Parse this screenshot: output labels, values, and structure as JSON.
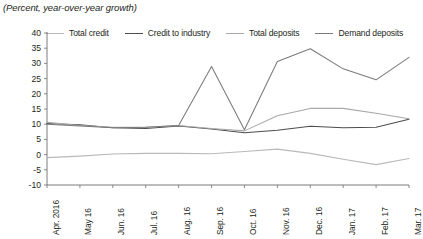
{
  "subtitle": "(Percent, year-over-year growth)",
  "colors": {
    "total_credit": "#b9b9b9",
    "credit_to_industry": "#4d4d4d",
    "total_deposits": "#a8a8a8",
    "demand_deposits": "#7a7a7a",
    "axis": "#6d6d6d",
    "text": "#231f20"
  },
  "legend": {
    "items": [
      {
        "label": "Total credit",
        "color": "#b9b9b9"
      },
      {
        "label": "Credit to industry",
        "color": "#4d4d4d"
      },
      {
        "label": "Total deposits",
        "color": "#a8a8a8"
      },
      {
        "label": "Demand deposits",
        "color": "#7a7a7a"
      }
    ]
  },
  "chart_data": {
    "type": "line",
    "title": "",
    "subtitle": "(Percent, year-over-year growth)",
    "xlabel": "",
    "ylabel": "",
    "ylim": [
      -10,
      40
    ],
    "ytick_step": 5,
    "yticks": [
      40,
      35,
      30,
      25,
      20,
      15,
      10,
      5,
      0,
      -5,
      -10
    ],
    "ytick_labels": [
      "40",
      "35",
      "30",
      "25",
      "20",
      "15",
      "10",
      "5",
      "0",
      "-5",
      "-10"
    ],
    "grid": false,
    "legend_position": "top",
    "categories": [
      "Apr. 2016",
      "May 16",
      "Jun. 16",
      "Jul. 16",
      "Aug. 16",
      "Sep. 16",
      "Oct. 16",
      "Nov. 16",
      "Dec. 16",
      "Jan. 17",
      "Feb. 17",
      "Mar. 17"
    ],
    "series": [
      {
        "name": "Total credit",
        "color": "#b9b9b9",
        "values": [
          -1.0,
          -0.5,
          0.2,
          0.4,
          0.4,
          0.3,
          1.0,
          1.8,
          0.4,
          -1.5,
          -3.3,
          -1.3
        ]
      },
      {
        "name": "Credit to industry",
        "color": "#4d4d4d",
        "values": [
          10.2,
          9.8,
          8.8,
          8.6,
          9.4,
          8.4,
          7.2,
          8.0,
          9.3,
          8.8,
          9.0,
          11.6
        ]
      },
      {
        "name": "Total deposits",
        "color": "#a8a8a8",
        "values": [
          10.6,
          9.6,
          9.0,
          9.0,
          9.6,
          8.6,
          7.8,
          12.8,
          15.2,
          15.2,
          13.6,
          11.8
        ]
      },
      {
        "name": "Demand deposits",
        "color": "#7a7a7a",
        "values": [
          10.0,
          9.4,
          8.8,
          9.0,
          9.6,
          29.0,
          8.2,
          30.6,
          34.8,
          28.2,
          24.6,
          32.0
        ]
      }
    ]
  }
}
